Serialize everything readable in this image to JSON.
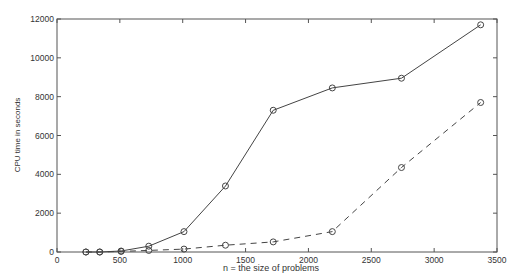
{
  "chart_data": {
    "type": "line",
    "title": "",
    "xlabel": "n = the size of problems",
    "ylabel": "CPU time in seconds",
    "xlim": [
      0,
      3500
    ],
    "ylim": [
      0,
      12000
    ],
    "xticks": [
      0,
      500,
      1000,
      1500,
      2000,
      2500,
      3000,
      3500
    ],
    "yticks": [
      0,
      2000,
      4000,
      6000,
      8000,
      10000,
      12000
    ],
    "grid": false,
    "legend": null,
    "x": [
      230,
      340,
      510,
      730,
      1010,
      1340,
      1720,
      2190,
      2740,
      3370
    ],
    "series": [
      {
        "name": "solid",
        "line_style": "solid",
        "marker": "circle",
        "color": "#444444",
        "values": [
          0,
          0,
          50,
          300,
          1050,
          3400,
          7300,
          8450,
          8950,
          11700
        ]
      },
      {
        "name": "dashed",
        "line_style": "dashed",
        "marker": "circle",
        "color": "#444444",
        "values": [
          0,
          0,
          30,
          80,
          150,
          350,
          520,
          1050,
          4350,
          7700
        ]
      }
    ]
  }
}
